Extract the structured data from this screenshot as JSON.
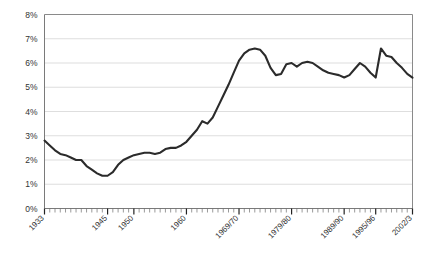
{
  "chart_data": {
    "type": "line",
    "title": "",
    "subtitle": "",
    "xlabel": "",
    "ylabel": "",
    "ylim": [
      0,
      8
    ],
    "xlim": [
      1933,
      2003
    ],
    "grid": true,
    "legend": false,
    "y_ticks": [
      0,
      1,
      2,
      3,
      4,
      5,
      6,
      7,
      8
    ],
    "y_tick_labels": [
      "0%",
      "1%",
      "2%",
      "3%",
      "4%",
      "5%",
      "6%",
      "7%",
      "8%"
    ],
    "x_tick_labels": [
      "1933",
      "1945",
      "1950",
      "1960",
      "1969/70",
      "1979/80",
      "1989/90",
      "1995/96",
      "2002/3"
    ],
    "x_tick_years": [
      1933,
      1945,
      1950,
      1960,
      1970,
      1980,
      1990,
      1996,
      2003
    ],
    "x_minor_tick_interval": 1,
    "line_color": "#2b2b2b",
    "gridline_color": "#c8c8c8",
    "series": [
      {
        "name": "",
        "x": [
          1933,
          1934,
          1935,
          1936,
          1937,
          1938,
          1939,
          1940,
          1941,
          1942,
          1943,
          1944,
          1945,
          1946,
          1947,
          1948,
          1949,
          1950,
          1951,
          1952,
          1953,
          1954,
          1955,
          1956,
          1957,
          1958,
          1959,
          1960,
          1961,
          1962,
          1963,
          1964,
          1965,
          1966,
          1967,
          1968,
          1969,
          1970,
          1971,
          1972,
          1973,
          1974,
          1975,
          1976,
          1977,
          1978,
          1979,
          1980,
          1981,
          1982,
          1983,
          1984,
          1985,
          1986,
          1987,
          1988,
          1989,
          1990,
          1991,
          1992,
          1993,
          1994,
          1995,
          1996,
          1997,
          1998,
          1999,
          2000,
          2001,
          2002,
          2003
        ],
        "values": [
          2.8,
          2.6,
          2.4,
          2.25,
          2.2,
          2.1,
          2.0,
          2.0,
          1.75,
          1.6,
          1.45,
          1.35,
          1.35,
          1.5,
          1.8,
          2.0,
          2.1,
          2.2,
          2.25,
          2.3,
          2.3,
          2.25,
          2.3,
          2.45,
          2.5,
          2.5,
          2.6,
          2.75,
          3.0,
          3.25,
          3.6,
          3.5,
          3.75,
          4.2,
          4.65,
          5.1,
          5.6,
          6.1,
          6.4,
          6.55,
          6.6,
          6.55,
          6.3,
          5.8,
          5.5,
          5.55,
          5.95,
          6.0,
          5.85,
          6.0,
          6.05,
          6.0,
          5.85,
          5.7,
          5.6,
          5.55,
          5.5,
          5.4,
          5.5,
          5.75,
          6.0,
          5.85,
          5.6,
          5.4,
          6.6,
          6.3,
          6.25,
          6.0,
          5.8,
          5.55,
          5.4
        ]
      }
    ]
  }
}
